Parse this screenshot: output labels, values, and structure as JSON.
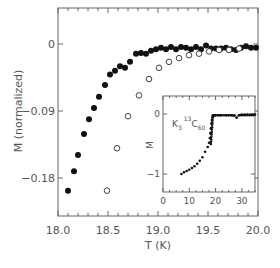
{
  "chart_data": [
    {
      "type": "scatter",
      "title": "",
      "xlabel": "T (K)",
      "ylabel": "M (normalized)",
      "xlim": [
        18.0,
        20.0
      ],
      "ylim": [
        -0.232,
        0.048
      ],
      "xticks": [
        "18.0",
        "18.5",
        "19.0",
        "19.5",
        "20.0"
      ],
      "yticks": [
        "0",
        "-0.09",
        "-0.18"
      ],
      "grid": false,
      "series": [
        {
          "name": "filled",
          "marker": "filled-circle",
          "x": [
            18.1,
            18.16,
            18.2,
            18.26,
            18.31,
            18.36,
            18.41,
            18.47,
            18.52,
            18.57,
            18.62,
            18.67,
            18.72,
            18.78,
            18.83,
            18.88,
            18.93,
            18.98,
            19.03,
            19.08,
            19.13,
            19.18,
            19.23,
            19.28,
            19.33,
            19.38,
            19.43,
            19.48,
            19.53,
            19.58,
            19.63,
            19.68,
            19.73,
            19.78,
            19.83,
            19.88,
            19.93,
            19.98
          ],
          "y": [
            -0.197,
            -0.171,
            -0.149,
            -0.121,
            -0.101,
            -0.086,
            -0.071,
            -0.055,
            -0.041,
            -0.036,
            -0.03,
            -0.032,
            -0.024,
            -0.013,
            -0.012,
            -0.013,
            -0.009,
            -0.007,
            -0.005,
            -0.007,
            -0.004,
            -0.007,
            -0.004,
            -0.005,
            -0.007,
            -0.004,
            -0.007,
            -0.002,
            -0.006,
            -0.006,
            -0.006,
            -0.005,
            -0.007,
            -0.008,
            -0.005,
            -0.003,
            -0.005,
            -0.005
          ]
        },
        {
          "name": "open",
          "marker": "open-circle",
          "x": [
            18.49,
            18.59,
            18.7,
            18.81,
            18.91,
            19.01,
            19.11,
            19.21,
            19.31,
            19.41,
            19.51,
            19.61,
            19.71,
            19.81
          ],
          "y": [
            -0.197,
            -0.14,
            -0.097,
            -0.069,
            -0.047,
            -0.032,
            -0.024,
            -0.019,
            -0.015,
            -0.013,
            -0.01,
            -0.008,
            -0.008,
            -0.006
          ]
        }
      ],
      "inset": {
        "type": "scatter",
        "xlabel": "",
        "ylabel": "M",
        "annotation": "K3 13C60",
        "annotation_parts": {
          "k": "K",
          "k_sub": "3",
          "c_sup": "13",
          "c": "C",
          "c_sub": "60"
        },
        "xlim": [
          0,
          35
        ],
        "ylim": [
          -1.3,
          0.3
        ],
        "xticks": [
          "0",
          "10",
          "20",
          "30"
        ],
        "yticks": [
          "0",
          "-1"
        ],
        "x": [
          7,
          8,
          9,
          10,
          11,
          12,
          13,
          14,
          15,
          16,
          17,
          17.5,
          17.8,
          18.0,
          18.2,
          18.4,
          18.6,
          18.8,
          19.0,
          19.3,
          19.6,
          20,
          21,
          22,
          24,
          25,
          26,
          27,
          28,
          29,
          30,
          31,
          32,
          33,
          34,
          35
        ],
        "y": [
          -1.0,
          -0.97,
          -0.95,
          -0.93,
          -0.9,
          -0.87,
          -0.83,
          -0.78,
          -0.72,
          -0.63,
          -0.55,
          -0.48,
          -0.4,
          -0.32,
          -0.24,
          -0.16,
          -0.1,
          -0.06,
          -0.04,
          -0.03,
          -0.02,
          -0.02,
          -0.02,
          -0.02,
          -0.02,
          -0.02,
          -0.02,
          -0.03,
          -0.06,
          -0.02,
          -0.01,
          -0.01,
          -0.01,
          -0.01,
          -0.01,
          -0.01
        ]
      }
    }
  ]
}
